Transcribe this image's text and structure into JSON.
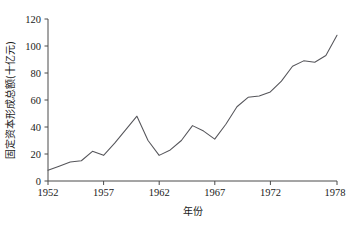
{
  "chart_data": {
    "type": "line",
    "title": "",
    "xlabel": "年份",
    "ylabel": "固定资本形成总额(十亿元)",
    "xlim": [
      1952,
      1978
    ],
    "ylim": [
      0,
      120
    ],
    "grid": false,
    "legend": null,
    "xticks": [
      1952,
      1957,
      1962,
      1967,
      1972,
      1978
    ],
    "xtick_labels": [
      "1952",
      "1957",
      "1962",
      "1967",
      "1972",
      "1978"
    ],
    "yticks": [
      0,
      20,
      40,
      60,
      80,
      100,
      120
    ],
    "ytick_labels": [
      "0",
      "20",
      "40",
      "60",
      "80",
      "100",
      "120"
    ],
    "series": [
      {
        "name": "固定资本形成总额",
        "color": "#55555a",
        "x": [
          1952,
          1953,
          1954,
          1955,
          1956,
          1957,
          1958,
          1959,
          1960,
          1961,
          1962,
          1963,
          1964,
          1965,
          1966,
          1967,
          1968,
          1969,
          1970,
          1971,
          1972,
          1973,
          1974,
          1975,
          1976,
          1977,
          1978
        ],
        "values": [
          8,
          11,
          14,
          15,
          22,
          19,
          28,
          38,
          48,
          30,
          19,
          23,
          30,
          41,
          37,
          31,
          42,
          55,
          62,
          63,
          66,
          74,
          85,
          89,
          88,
          93,
          108
        ]
      }
    ]
  },
  "axes": {
    "y_axis_name": "y-axis",
    "x_axis_name": "x-axis"
  }
}
